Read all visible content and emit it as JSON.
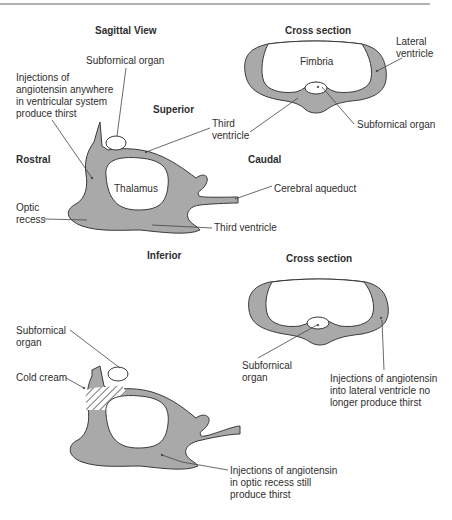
{
  "top": {
    "sagittal_title": "Sagittal View",
    "cross_title": "Cross section",
    "directions": {
      "superior": "Superior",
      "inferior": "Inferior",
      "rostral": "Rostral",
      "caudal": "Caudal"
    },
    "labels": {
      "subfornical_organ": "Subfornical organ",
      "injections_note": "Injections of\nangiotensin anywhere\nin ventricular system\nproduce thirst",
      "third_ventricle_upper": "Third\nventricle",
      "thalamus": "Thalamus",
      "cerebral_aqueduct": "Cerebral aqueduct",
      "optic_recess": "Optic\nrecess",
      "third_ventricle_lower": "Third ventricle",
      "fimbria": "Fimbria",
      "lateral_ventricle": "Lateral\nventricle",
      "cross_subfornical_organ": "Subfornical organ"
    }
  },
  "bottom": {
    "cross_title": "Cross section",
    "labels": {
      "subfornical_organ": "Subfornical\norgan",
      "cold_cream": "Cold cream",
      "cross_subfornical_organ": "Subfornical\norgan",
      "lateral_note": "Injections of angiotensin\ninto lateral ventricle no\nlonger produce thirst",
      "optic_note": "Injections of angiotensin\nin optic recess still\nproduce thirst"
    }
  },
  "colors": {
    "ventricle_fill": "#a9a9a9",
    "outline": "#3a3a3a",
    "background": "#ffffff"
  }
}
